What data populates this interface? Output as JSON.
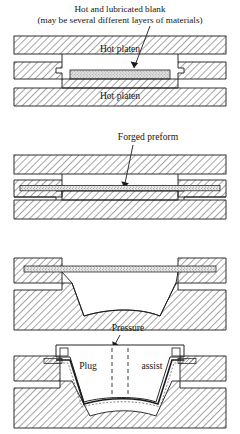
{
  "figure": {
    "type": "process-diagram",
    "stage_count": 4
  },
  "labels": {
    "blank_line1": "Hot and lubricated blank",
    "blank_line2": "(may be several different layers of materials)",
    "hot_platen_upper": "Hot platen",
    "hot_platen_lower": "Hot platen",
    "forged_preform": "Forged preform",
    "pressure": "Pressure",
    "plug": "Plug",
    "assist": "assist"
  },
  "colors": {
    "stroke": "#1a1a1a",
    "hatch": "#3a3a3a",
    "blank_fill": "#cfcfcf",
    "platen_fill": "#ffffff",
    "page_bg": "#ffffff"
  },
  "stages": [
    {
      "index": 1,
      "name": "blank-placed-in-open-die",
      "callouts": [
        "Hot and lubricated blank",
        "Hot platen",
        "Hot platen"
      ]
    },
    {
      "index": 2,
      "name": "die-closed-forged-preform",
      "callouts": [
        "Forged preform"
      ]
    },
    {
      "index": 3,
      "name": "preform-released-over-cavity",
      "callouts": []
    },
    {
      "index": 4,
      "name": "plug-assist-pressure-forming",
      "callouts": [
        "Pressure",
        "Plug",
        "assist"
      ]
    }
  ]
}
